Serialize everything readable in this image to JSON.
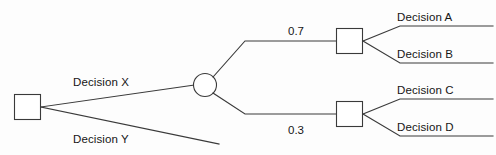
{
  "diagram": {
    "type": "decision-tree",
    "background_color": "#fdfdfd",
    "line_color": "#3a3a3a",
    "text_color": "#161616",
    "nodes": [
      {
        "id": "root",
        "shape": "square",
        "role": "decision"
      },
      {
        "id": "chance",
        "shape": "circle",
        "role": "chance"
      },
      {
        "id": "decision-ab",
        "shape": "square",
        "role": "decision"
      },
      {
        "id": "decision-cd",
        "shape": "square",
        "role": "decision"
      }
    ],
    "edge_labels": {
      "decision_x": "Decision X",
      "decision_y": "Decision Y",
      "decision_a": "Decision A",
      "decision_b": "Decision B",
      "decision_c": "Decision C",
      "decision_d": "Decision D"
    },
    "probabilities": {
      "upper_branch": "0.7",
      "lower_branch": "0.3"
    }
  }
}
